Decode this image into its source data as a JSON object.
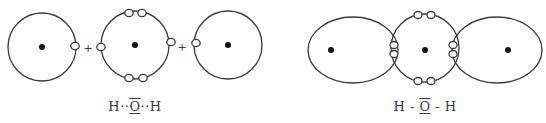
{
  "colors": {
    "stroke": "#3a3a3a",
    "nucleus": "#111111",
    "electron_fill": "#ffffff",
    "background": "#ffffff"
  },
  "left_diagram": {
    "description": "Separate atoms combining: H + O + H",
    "plus_signs": [
      "+",
      "+"
    ],
    "atoms": [
      {
        "element": "H",
        "shape": "circle",
        "cx": 42,
        "cy": 47,
        "r": 34,
        "electrons": [
          [
            75,
            46
          ]
        ]
      },
      {
        "element": "O",
        "shape": "circle",
        "cx": 135,
        "cy": 45,
        "r": 34,
        "electrons": [
          [
            129,
            13
          ],
          [
            142,
            13
          ],
          [
            129,
            78
          ],
          [
            143,
            78
          ],
          [
            101,
            47
          ],
          [
            171,
            42
          ]
        ]
      },
      {
        "element": "H",
        "shape": "circle",
        "cx": 228,
        "cy": 45,
        "r": 34,
        "electrons": [
          [
            196,
            43
          ]
        ]
      }
    ],
    "formula": {
      "left": "H··",
      "center": "O",
      "right": "··H"
    }
  },
  "right_diagram": {
    "description": "Water molecule with shared electron pairs (overlapping orbitals)",
    "atoms": [
      {
        "element": "H",
        "shape": "ellipse",
        "cx": 353,
        "cy": 50,
        "rx": 45,
        "ry": 33,
        "nucleus": [
          331,
          50
        ]
      },
      {
        "element": "O",
        "shape": "circle",
        "cx": 425,
        "cy": 48,
        "r": 34,
        "nucleus": [
          425,
          50
        ],
        "electrons": [
          [
            418,
            15
          ],
          [
            431,
            15
          ],
          [
            418,
            81
          ],
          [
            431,
            81
          ],
          [
            394,
            45
          ],
          [
            394,
            54
          ],
          [
            453,
            45
          ],
          [
            453,
            54
          ]
        ]
      },
      {
        "element": "H",
        "shape": "ellipse",
        "cx": 497,
        "cy": 50,
        "rx": 45,
        "ry": 33,
        "nucleus": [
          508,
          50
        ]
      }
    ],
    "formula": {
      "left": "H - ",
      "center": "O",
      "right": " - H"
    }
  }
}
